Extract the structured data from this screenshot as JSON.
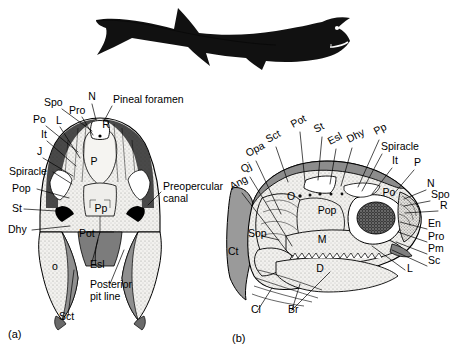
{
  "figure": {
    "silhouette": {
      "name": "fossil fish body silhouette",
      "eye": "white eye dot"
    },
    "panels": [
      {
        "id": "(a)",
        "view": "dorsal skull roof"
      },
      {
        "id": "(b)",
        "view": "lateral skull"
      }
    ]
  },
  "colors": {
    "ink": "#000000",
    "paper": "#ffffff",
    "bone_light": "#f0efec",
    "bone_stipple": "#d9d7d2",
    "gray_mid": "#9a9a9a",
    "gray_dark": "#6e6e6e",
    "gray_darker": "#4a4a4a",
    "silhouette": "#111111"
  },
  "panel_a": {
    "id": "(a)",
    "labels": [
      {
        "key": "spo",
        "text": "Spo",
        "x": 44,
        "y": 106,
        "anchor": "start"
      },
      {
        "key": "n",
        "text": "N",
        "x": 92,
        "y": 100,
        "anchor": "middle"
      },
      {
        "key": "pineal",
        "text": "Pineal foramen",
        "x": 113,
        "y": 103,
        "anchor": "start"
      },
      {
        "key": "pro",
        "text": "Pro",
        "x": 69,
        "y": 114,
        "anchor": "start"
      },
      {
        "key": "po",
        "text": "Po",
        "x": 33,
        "y": 123,
        "anchor": "start"
      },
      {
        "key": "l",
        "text": "L",
        "x": 56,
        "y": 124,
        "anchor": "start"
      },
      {
        "key": "it",
        "text": "It",
        "x": 41,
        "y": 138,
        "anchor": "start"
      },
      {
        "key": "j",
        "text": "J",
        "x": 37,
        "y": 155,
        "anchor": "start"
      },
      {
        "key": "spiracle",
        "text": "Spiracle",
        "x": 9,
        "y": 175,
        "anchor": "start"
      },
      {
        "key": "pop",
        "text": "Pop",
        "x": 12,
        "y": 192,
        "anchor": "start"
      },
      {
        "key": "st",
        "text": "St",
        "x": 12,
        "y": 212,
        "anchor": "start"
      },
      {
        "key": "dhy",
        "text": "Dhy",
        "x": 8,
        "y": 233,
        "anchor": "start"
      },
      {
        "key": "r",
        "text": "R",
        "x": 106,
        "y": 128,
        "anchor": "middle"
      },
      {
        "key": "p",
        "text": "P",
        "x": 94,
        "y": 165,
        "anchor": "middle"
      },
      {
        "key": "pp",
        "text": "Pp",
        "x": 101,
        "y": 212,
        "anchor": "middle"
      },
      {
        "key": "pot",
        "text": "Pot",
        "x": 79,
        "y": 237,
        "anchor": "start"
      },
      {
        "key": "o",
        "text": "o",
        "x": 55,
        "y": 270,
        "anchor": "middle"
      },
      {
        "key": "esl",
        "text": "Esl",
        "x": 90,
        "y": 268,
        "anchor": "start"
      },
      {
        "key": "ppl1",
        "text": "Posterior",
        "x": 90,
        "y": 288,
        "anchor": "start"
      },
      {
        "key": "ppl2",
        "text": "pit line",
        "x": 90,
        "y": 300,
        "anchor": "start"
      },
      {
        "key": "sct",
        "text": "Sct",
        "x": 59,
        "y": 320,
        "anchor": "start"
      },
      {
        "key": "prec1",
        "text": "Preopercular",
        "x": 163,
        "y": 190,
        "anchor": "start"
      },
      {
        "key": "prec2",
        "text": "canal",
        "x": 163,
        "y": 202,
        "anchor": "start"
      }
    ],
    "leaders": [
      {
        "key": "spo",
        "d": "M62,109 L92,131"
      },
      {
        "key": "n",
        "d": "M92,104 L96,120"
      },
      {
        "key": "pineal",
        "d": "M112,106 L104,121"
      },
      {
        "key": "pro",
        "d": "M82,117 L93,135"
      },
      {
        "key": "po",
        "d": "M46,126 L78,152"
      },
      {
        "key": "l",
        "d": "M60,127 L80,158"
      },
      {
        "key": "it",
        "d": "M47,141 L76,166"
      },
      {
        "key": "j",
        "d": "M43,158 L73,176"
      },
      {
        "key": "spiracle",
        "d": "M53,172 L72,184"
      },
      {
        "key": "pop",
        "d": "M37,189 L69,198"
      },
      {
        "key": "st",
        "d": "M24,209 L72,212"
      },
      {
        "key": "dhy",
        "d": "M32,230 L70,226"
      },
      {
        "key": "esl",
        "d": "M92,262 L98,240"
      },
      {
        "key": "ppl",
        "d": "M110,284 L124,250"
      },
      {
        "key": "sct",
        "d": "M68,316 L74,270"
      },
      {
        "key": "prec",
        "d": "M161,192 L148,205"
      }
    ]
  },
  "panel_b": {
    "id": "(b)",
    "labels": [
      {
        "key": "pot",
        "text": "Pot",
        "x": 293,
        "y": 128,
        "anchor": "start",
        "rot": -28
      },
      {
        "key": "st",
        "text": "St",
        "x": 316,
        "y": 133,
        "anchor": "start",
        "rot": -28
      },
      {
        "key": "esl",
        "text": "Esl",
        "x": 330,
        "y": 145,
        "anchor": "start",
        "rot": -28
      },
      {
        "key": "dhy",
        "text": "Dhy",
        "x": 349,
        "y": 143,
        "anchor": "start",
        "rot": -28
      },
      {
        "key": "pp",
        "text": "Pp",
        "x": 376,
        "y": 135,
        "anchor": "start",
        "rot": -28
      },
      {
        "key": "spiracle",
        "text": "Spiracle",
        "x": 381,
        "y": 150,
        "anchor": "start"
      },
      {
        "key": "it",
        "text": "It",
        "x": 392,
        "y": 164,
        "anchor": "start"
      },
      {
        "key": "p",
        "text": "P",
        "x": 414,
        "y": 166,
        "anchor": "start"
      },
      {
        "key": "sct",
        "text": "Sct",
        "x": 268,
        "y": 143,
        "anchor": "start",
        "rot": -28
      },
      {
        "key": "opa",
        "text": "Opa",
        "x": 248,
        "y": 157,
        "anchor": "start",
        "rot": -28
      },
      {
        "key": "qj",
        "text": "Qj",
        "x": 243,
        "y": 173,
        "anchor": "start",
        "rot": -28
      },
      {
        "key": "ang",
        "text": "Ang",
        "x": 232,
        "y": 190,
        "anchor": "start",
        "rot": -28
      },
      {
        "key": "n",
        "text": "N",
        "x": 427,
        "y": 187,
        "anchor": "start"
      },
      {
        "key": "spo",
        "text": "Spo",
        "x": 431,
        "y": 198,
        "anchor": "start"
      },
      {
        "key": "r",
        "text": "R",
        "x": 440,
        "y": 209,
        "anchor": "start"
      },
      {
        "key": "en",
        "text": "En",
        "x": 428,
        "y": 227,
        "anchor": "start"
      },
      {
        "key": "pro",
        "text": "Pro",
        "x": 428,
        "y": 240,
        "anchor": "start"
      },
      {
        "key": "pm",
        "text": "Pm",
        "x": 428,
        "y": 252,
        "anchor": "start"
      },
      {
        "key": "sc",
        "text": "Sc",
        "x": 428,
        "y": 264,
        "anchor": "start"
      },
      {
        "key": "l",
        "text": "L",
        "x": 407,
        "y": 272,
        "anchor": "start"
      },
      {
        "key": "o",
        "text": "O",
        "x": 291,
        "y": 200,
        "anchor": "middle"
      },
      {
        "key": "po",
        "text": "Po",
        "x": 389,
        "y": 196,
        "anchor": "middle"
      },
      {
        "key": "pop",
        "text": "Pop",
        "x": 327,
        "y": 214,
        "anchor": "middle"
      },
      {
        "key": "m",
        "text": "M",
        "x": 322,
        "y": 243,
        "anchor": "middle"
      },
      {
        "key": "d",
        "text": "D",
        "x": 320,
        "y": 272,
        "anchor": "middle"
      },
      {
        "key": "sop",
        "text": "Sop",
        "x": 248,
        "y": 237,
        "anchor": "start"
      },
      {
        "key": "ct",
        "text": "Ct",
        "x": 228,
        "y": 255,
        "anchor": "start"
      },
      {
        "key": "cl",
        "text": "Cl",
        "x": 251,
        "y": 313,
        "anchor": "start"
      },
      {
        "key": "br",
        "text": "Br",
        "x": 288,
        "y": 313,
        "anchor": "start"
      }
    ],
    "leaders": [
      {
        "key": "pot",
        "d": "M300,132 L305,182"
      },
      {
        "key": "st",
        "d": "M322,137 L318,180"
      },
      {
        "key": "esl",
        "d": "M336,149 L330,184"
      },
      {
        "key": "dhy",
        "d": "M352,148 L341,186"
      },
      {
        "key": "pp",
        "d": "M379,140 L358,187"
      },
      {
        "key": "spi",
        "d": "M382,154 L362,191"
      },
      {
        "key": "it",
        "d": "M392,168 L372,194"
      },
      {
        "key": "p",
        "d": "M414,170 L392,196"
      },
      {
        "key": "sct",
        "d": "M276,147 L288,182"
      },
      {
        "key": "opa",
        "d": "M256,161 L281,214"
      },
      {
        "key": "qj",
        "d": "M250,177 L292,246"
      },
      {
        "key": "ang",
        "d": "M242,193 L286,250"
      },
      {
        "key": "n",
        "d": "M426,190 L404,199"
      },
      {
        "key": "spo",
        "d": "M430,201 L404,206"
      },
      {
        "key": "r",
        "d": "M438,211 L405,213"
      },
      {
        "key": "en",
        "d": "M427,229 L400,222"
      },
      {
        "key": "pro",
        "d": "M427,242 L398,232"
      },
      {
        "key": "pm",
        "d": "M427,254 L396,242"
      },
      {
        "key": "sc",
        "d": "M427,266 L392,250"
      },
      {
        "key": "l",
        "d": "M405,270 L372,246"
      },
      {
        "key": "sop",
        "d": "M262,236 L279,240"
      },
      {
        "key": "cl",
        "d": "M258,310 L272,288"
      },
      {
        "key": "br1",
        "d": "M292,310 L300,284"
      },
      {
        "key": "br2",
        "d": "M292,310 L330,272"
      }
    ]
  }
}
